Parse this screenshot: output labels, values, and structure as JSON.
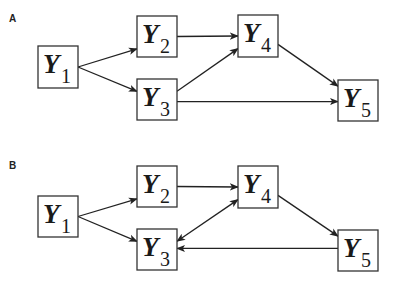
{
  "panels": [
    {
      "label": "A",
      "nodes": [
        {
          "id": "Y1",
          "letter": "Y",
          "sub": "1",
          "x": 38,
          "y": 46,
          "w": 40,
          "h": 42
        },
        {
          "id": "Y2",
          "letter": "Y",
          "sub": "2",
          "x": 137,
          "y": 16,
          "w": 40,
          "h": 41
        },
        {
          "id": "Y3",
          "letter": "Y",
          "sub": "3",
          "x": 137,
          "y": 79,
          "w": 40,
          "h": 41
        },
        {
          "id": "Y4",
          "letter": "Y",
          "sub": "4",
          "x": 238,
          "y": 15,
          "w": 40,
          "h": 42
        },
        {
          "id": "Y5",
          "letter": "Y",
          "sub": "5",
          "x": 338,
          "y": 80,
          "w": 40,
          "h": 41
        }
      ],
      "edges": [
        {
          "from": "Y1",
          "to": "Y2",
          "type": "directed"
        },
        {
          "from": "Y1",
          "to": "Y3",
          "type": "directed"
        },
        {
          "from": "Y2",
          "to": "Y4",
          "type": "directed"
        },
        {
          "from": "Y3",
          "to": "Y4",
          "type": "directed"
        },
        {
          "from": "Y4",
          "to": "Y5",
          "type": "directed"
        },
        {
          "from": "Y3",
          "to": "Y5",
          "type": "directed"
        }
      ]
    },
    {
      "label": "B",
      "nodes": [
        {
          "id": "Y1",
          "letter": "Y",
          "sub": "1",
          "x": 38,
          "y": 196,
          "w": 40,
          "h": 41
        },
        {
          "id": "Y2",
          "letter": "Y",
          "sub": "2",
          "x": 137,
          "y": 166,
          "w": 40,
          "h": 41
        },
        {
          "id": "Y3",
          "letter": "Y",
          "sub": "3",
          "x": 137,
          "y": 229,
          "w": 40,
          "h": 41
        },
        {
          "id": "Y4",
          "letter": "Y",
          "sub": "4",
          "x": 238,
          "y": 166,
          "w": 40,
          "h": 42
        },
        {
          "id": "Y5",
          "letter": "Y",
          "sub": "5",
          "x": 338,
          "y": 230,
          "w": 40,
          "h": 41
        }
      ],
      "edges": [
        {
          "from": "Y1",
          "to": "Y2",
          "type": "directed"
        },
        {
          "from": "Y1",
          "to": "Y3",
          "type": "directed"
        },
        {
          "from": "Y2",
          "to": "Y4",
          "type": "directed"
        },
        {
          "from": "Y3",
          "to": "Y4",
          "type": "bidirected"
        },
        {
          "from": "Y4",
          "to": "Y5",
          "type": "directed"
        },
        {
          "from": "Y5",
          "to": "Y3",
          "type": "directed"
        }
      ]
    }
  ]
}
